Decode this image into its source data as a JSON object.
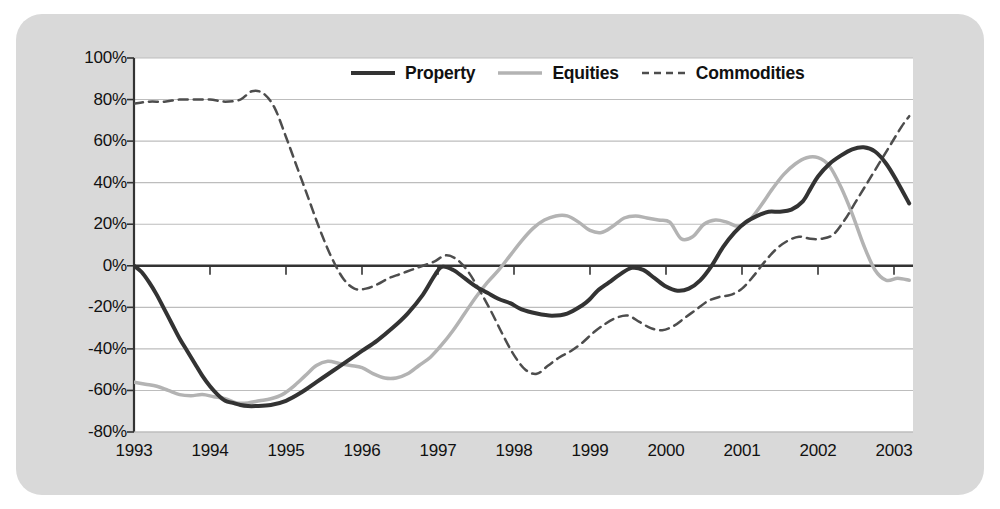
{
  "chart_data": {
    "type": "line",
    "title": "",
    "xlabel": "",
    "ylabel": "",
    "xlim": [
      1993,
      2003.25
    ],
    "ylim": [
      -80,
      100
    ],
    "ytick_labels": [
      "100%",
      "80%",
      "60%",
      "40%",
      "20%",
      "0%",
      "-20%",
      "-40%",
      "-60%",
      "-80%"
    ],
    "ytick_values": [
      100,
      80,
      60,
      40,
      20,
      0,
      -20,
      -40,
      -60,
      -80
    ],
    "xtick_labels": [
      "1993",
      "1994",
      "1995",
      "1996",
      "1997",
      "1998",
      "1999",
      "2000",
      "2001",
      "2002",
      "2003"
    ],
    "xtick_values": [
      1993,
      1994,
      1995,
      1996,
      1997,
      1998,
      1999,
      2000,
      2001,
      2002,
      2003
    ],
    "grid": true,
    "legend_position": "top-center",
    "zero_line": 0,
    "series": [
      {
        "name": "Property",
        "style": "solid",
        "color": "#333333",
        "width": 4,
        "x": [
          1993.0,
          1993.1,
          1993.2,
          1993.3,
          1993.4,
          1993.5,
          1993.6,
          1993.7,
          1993.8,
          1993.9,
          1994.0,
          1994.1,
          1994.2,
          1994.3,
          1994.4,
          1994.5,
          1994.6,
          1994.8,
          1995.0,
          1995.2,
          1995.4,
          1995.6,
          1995.8,
          1996.0,
          1996.2,
          1996.4,
          1996.6,
          1996.8,
          1996.95,
          1997.05,
          1997.2,
          1997.35,
          1997.5,
          1997.65,
          1997.8,
          1997.95,
          1998.1,
          1998.3,
          1998.5,
          1998.7,
          1998.9,
          1999.0,
          1999.1,
          1999.25,
          1999.4,
          1999.55,
          1999.7,
          1999.85,
          2000.0,
          2000.15,
          2000.3,
          2000.45,
          2000.6,
          2000.75,
          2000.9,
          2001.05,
          2001.2,
          2001.35,
          2001.5,
          2001.65,
          2001.8,
          2001.9,
          2002.0,
          2002.15,
          2002.3,
          2002.45,
          2002.6,
          2002.75,
          2002.9,
          2003.05,
          2003.2
        ],
        "y": [
          0,
          -3,
          -8,
          -14,
          -21,
          -28,
          -35,
          -41,
          -47,
          -53,
          -58,
          -62,
          -65,
          -66,
          -67,
          -67.5,
          -67.5,
          -67,
          -65,
          -61,
          -56,
          -51,
          -46,
          -41,
          -36,
          -30,
          -23,
          -14,
          -5,
          -0.5,
          -2,
          -6,
          -10,
          -13,
          -16,
          -18,
          -21,
          -23,
          -24,
          -23,
          -19,
          -16,
          -12,
          -8,
          -4,
          -1,
          -2,
          -6,
          -10,
          -12,
          -11,
          -7,
          0,
          9,
          16,
          21,
          24,
          26,
          26,
          27,
          31,
          37,
          43,
          49,
          53,
          56,
          57,
          55,
          49,
          40,
          30
        ]
      },
      {
        "name": "Equities",
        "style": "solid",
        "color": "#b3b3b3",
        "width": 3.5,
        "x": [
          1993.0,
          1993.15,
          1993.3,
          1993.45,
          1993.6,
          1993.75,
          1993.9,
          1994.05,
          1994.2,
          1994.35,
          1994.5,
          1994.65,
          1994.8,
          1994.95,
          1995.1,
          1995.25,
          1995.4,
          1995.55,
          1995.7,
          1995.85,
          1996.0,
          1996.15,
          1996.3,
          1996.45,
          1996.6,
          1996.75,
          1996.9,
          1997.05,
          1997.2,
          1997.35,
          1997.5,
          1997.65,
          1997.8,
          1997.95,
          1998.1,
          1998.25,
          1998.4,
          1998.55,
          1998.7,
          1998.85,
          1999.0,
          1999.15,
          1999.3,
          1999.45,
          1999.6,
          1999.75,
          1999.9,
          2000.05,
          2000.2,
          2000.35,
          2000.5,
          2000.65,
          2000.8,
          2000.95,
          2001.1,
          2001.25,
          2001.4,
          2001.55,
          2001.7,
          2001.85,
          2002.0,
          2002.15,
          2002.3,
          2002.45,
          2002.6,
          2002.75,
          2002.9,
          2003.05,
          2003.2
        ],
        "y": [
          -56,
          -57,
          -58,
          -60,
          -62,
          -62.5,
          -62,
          -63,
          -64,
          -66,
          -66,
          -65,
          -64,
          -62,
          -58,
          -53,
          -48,
          -46,
          -47,
          -48,
          -49,
          -52,
          -54,
          -54,
          -52,
          -48,
          -44,
          -38,
          -31,
          -23,
          -15,
          -8,
          -2,
          5,
          12,
          18,
          22,
          24,
          24,
          21,
          17,
          16,
          19,
          23,
          24,
          23,
          22,
          21,
          13,
          14,
          20,
          22,
          21,
          19,
          22,
          29,
          37,
          44,
          49,
          52,
          52,
          48,
          38,
          25,
          10,
          -2,
          -7,
          -6,
          -7
        ]
      },
      {
        "name": "Commodities",
        "style": "dashed",
        "color": "#4d4d4d",
        "width": 2.5,
        "x": [
          1993.0,
          1993.2,
          1993.4,
          1993.6,
          1993.8,
          1994.0,
          1994.2,
          1994.4,
          1994.55,
          1994.7,
          1994.85,
          1995.0,
          1995.15,
          1995.3,
          1995.45,
          1995.6,
          1995.75,
          1995.9,
          1996.05,
          1996.2,
          1996.35,
          1996.5,
          1996.65,
          1996.8,
          1996.95,
          1997.1,
          1997.25,
          1997.4,
          1997.55,
          1997.7,
          1997.85,
          1998.0,
          1998.15,
          1998.3,
          1998.45,
          1998.6,
          1998.75,
          1998.9,
          1999.05,
          1999.2,
          1999.35,
          1999.5,
          1999.65,
          1999.8,
          1999.95,
          2000.1,
          2000.25,
          2000.4,
          2000.55,
          2000.7,
          2000.85,
          2001.0,
          2001.15,
          2001.3,
          2001.45,
          2001.6,
          2001.75,
          2001.9,
          2002.05,
          2002.2,
          2002.35,
          2002.5,
          2002.65,
          2002.8,
          2002.95,
          2003.1,
          2003.2
        ],
        "y": [
          78,
          79,
          79,
          80,
          80,
          80,
          79,
          80,
          84,
          83,
          76,
          62,
          47,
          32,
          17,
          4,
          -6,
          -11,
          -11,
          -9,
          -6,
          -4,
          -2,
          0,
          2,
          5,
          3,
          -3,
          -12,
          -22,
          -33,
          -43,
          -50,
          -52,
          -48,
          -44,
          -41,
          -37,
          -32,
          -28,
          -25,
          -24,
          -27,
          -30,
          -31,
          -29,
          -25,
          -21,
          -17,
          -15,
          -14,
          -11,
          -5,
          2,
          8,
          12,
          14,
          13,
          13,
          15,
          22,
          31,
          40,
          49,
          58,
          67,
          72
        ]
      }
    ]
  },
  "legend": {
    "items": [
      {
        "label": "Property",
        "swatch": "solid-dark-line"
      },
      {
        "label": "Equities",
        "swatch": "solid-grey-line"
      },
      {
        "label": "Commodities",
        "swatch": "dashed-dark-line"
      }
    ]
  },
  "colors": {
    "panel_background": "#d9d9d9",
    "plot_background": "#ffffff",
    "gridline": "#bdbdbd",
    "axis": "#333333",
    "property": "#333333",
    "equities": "#b3b3b3",
    "commodities": "#4d4d4d",
    "text": "#111111"
  }
}
